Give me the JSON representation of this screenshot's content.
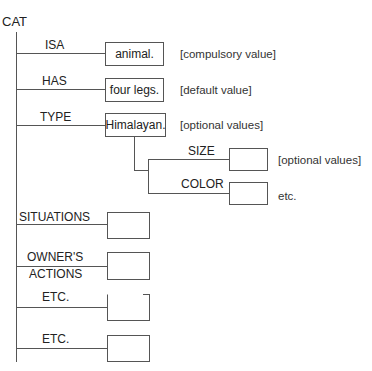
{
  "root": {
    "label": "CAT"
  },
  "slots": [
    {
      "label": "ISA",
      "value": "animal.",
      "note": "[compulsory value]"
    },
    {
      "label": "HAS",
      "value": "four legs.",
      "note": "[default value]"
    },
    {
      "label": "TYPE",
      "value": "Himalayan.",
      "note": "[optional values]"
    },
    {
      "label": "SITUATIONS",
      "value": ""
    },
    {
      "label_line1": "OWNER'S",
      "label_line2": "ACTIONS",
      "value": ""
    },
    {
      "label": "ETC.",
      "value": ""
    },
    {
      "label": "ETC.",
      "value": ""
    }
  ],
  "subslots": [
    {
      "label": "SIZE",
      "value": "",
      "note": "[optional values]"
    },
    {
      "label": "COLOR",
      "value": "",
      "note": "etc."
    }
  ]
}
